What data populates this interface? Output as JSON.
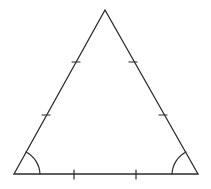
{
  "diagram": {
    "type": "equilateral-triangle",
    "stroke_color": "#2b2b2b",
    "background": "#ffffff",
    "vertices": {
      "apex": [
        105,
        10
      ],
      "base_left": [
        14,
        174
      ],
      "base_right": [
        198,
        174
      ]
    },
    "tick_marks": {
      "left_side": [
        [
          76,
          62
        ],
        [
          46,
          115
        ]
      ],
      "right_side": [
        [
          133,
          62
        ],
        [
          163,
          115
        ]
      ],
      "base": [
        [
          74,
          175
        ],
        [
          136,
          175
        ]
      ]
    },
    "angle_marks": [
      "base_left",
      "base_right"
    ],
    "labels": []
  }
}
